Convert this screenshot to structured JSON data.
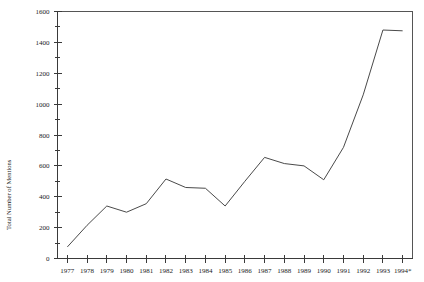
{
  "chart_data": {
    "type": "line",
    "title": "",
    "subtitle": "",
    "xlabel": "",
    "ylabel": "Total Number of Mentions",
    "x": [
      "1977",
      "1978",
      "1979",
      "1980",
      "1981",
      "1982",
      "1983",
      "1984",
      "1985",
      "1986",
      "1987",
      "1988",
      "1989",
      "1990",
      "1991",
      "1992",
      "1993",
      "1994*"
    ],
    "categories": [
      "1977",
      "1978",
      "1979",
      "1980",
      "1981",
      "1982",
      "1983",
      "1984",
      "1985",
      "1986",
      "1987",
      "1988",
      "1989",
      "1990",
      "1991",
      "1992",
      "1993",
      "1994*"
    ],
    "values": [
      75,
      215,
      340,
      300,
      355,
      515,
      460,
      455,
      340,
      500,
      655,
      615,
      600,
      510,
      720,
      1060,
      1480,
      1475
    ],
    "series": [
      {
        "name": "Total Number of Mentions",
        "values": [
          75,
          215,
          340,
          300,
          355,
          515,
          460,
          455,
          340,
          500,
          655,
          615,
          600,
          510,
          720,
          1060,
          1480,
          1475
        ]
      }
    ],
    "ylim": [
      0,
      1600
    ],
    "ytick_major": [
      0,
      200,
      400,
      600,
      800,
      1000,
      1200,
      1400,
      1600
    ],
    "ytick_minor": [
      100,
      300,
      500,
      700,
      900,
      1100,
      1300,
      1500
    ],
    "ytick_labels": [
      "0",
      "200",
      "400",
      "600",
      "800",
      "1000",
      "1200",
      "1400",
      "1600"
    ],
    "xtick_labels": [
      "1977",
      "1978",
      "1979",
      "1980",
      "1981",
      "1982",
      "1983",
      "1984",
      "1985",
      "1986",
      "1987",
      "1988",
      "1989",
      "1990",
      "1991",
      "1992",
      "1993",
      "1994*"
    ],
    "grid": false,
    "legend": false,
    "legend_position": "none",
    "line_color": "#4a4a4a",
    "axis_color": "#3a3a3a",
    "background_color": "#ffffff",
    "annotations": [
      "1994 value marked with asterisk"
    ]
  }
}
